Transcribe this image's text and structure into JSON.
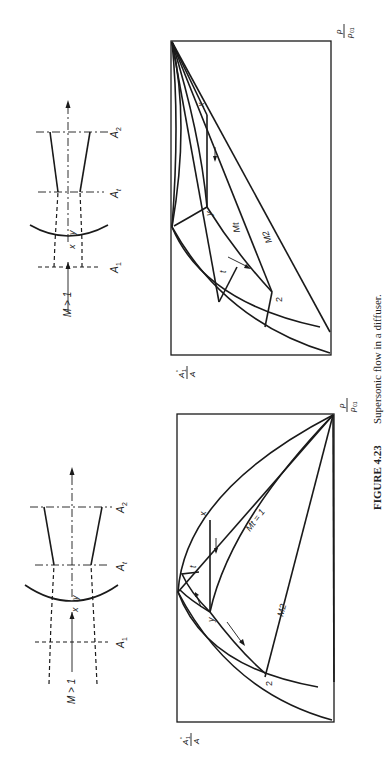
{
  "caption": {
    "figure_number": "FIGURE 4.23",
    "text": "Supersonic flow in a diffuser."
  },
  "panels": [
    {
      "id": "left",
      "sketch": {
        "inlet_label": "M > 1",
        "shock_upstream": "x",
        "shock_downstream": "y",
        "sections": [
          "A1",
          "At",
          "A2"
        ],
        "section_subscripts": [
          "1",
          "t",
          "2"
        ]
      },
      "chart": {
        "y_axis_label_num": "A1*",
        "y_axis_label_den": "A",
        "x_axis_label_num": "p",
        "x_axis_label_den": "p01",
        "point_labels": [
          "x",
          "y",
          "t",
          "2"
        ],
        "line_labels": [
          "Mt = 1",
          "M2"
        ]
      }
    },
    {
      "id": "right",
      "sketch": {
        "inlet_label": "M > 1",
        "shock_upstream": "x",
        "shock_downstream": "y",
        "sections": [
          "A1",
          "At",
          "A2"
        ]
      },
      "chart": {
        "y_axis_label_num": "A1*",
        "y_axis_label_den": "A",
        "x_axis_label_num": "p",
        "x_axis_label_den": "p01",
        "point_labels": [
          "x",
          "y",
          "t",
          "2"
        ],
        "line_labels": [
          "Mt",
          "M2"
        ]
      }
    }
  ],
  "labels": {
    "M_gt_1": "M > 1",
    "x": "x",
    "y": "y",
    "t": "t",
    "two": "2",
    "A": "A",
    "one": "1",
    "sub_t": "t",
    "sub_2": "2",
    "M": "M",
    "eq1": "= 1",
    "p": "p",
    "p0": "p",
    "sub01": "01",
    "star": "*"
  }
}
